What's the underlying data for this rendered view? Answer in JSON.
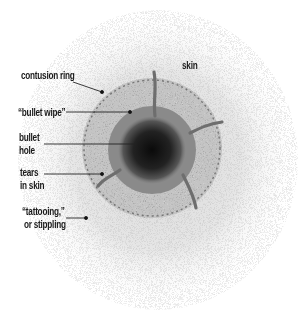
{
  "diagram": {
    "labels": [
      {
        "id": "skin",
        "text": "skin"
      },
      {
        "id": "contusion_ring",
        "text": "contusion ring"
      },
      {
        "id": "bullet_wipe",
        "text": "“bullet wipe”"
      },
      {
        "id": "bullet_hole_1",
        "text": "bullet"
      },
      {
        "id": "bullet_hole_2",
        "text": "hole"
      },
      {
        "id": "tears_1",
        "text": "tears"
      },
      {
        "id": "tears_2",
        "text": "in skin"
      },
      {
        "id": "tattooing_1",
        "text": "“tattooing,”"
      },
      {
        "id": "tattooing_2",
        "text": "or stippling"
      }
    ],
    "colors": {
      "background": "#ffffff",
      "skin_speckle": "#b8b8b8",
      "stipple_zone": "#9a9a9a",
      "wipe_ring": "#7a7a7a",
      "hole": "#111111",
      "leader_line": "#222222"
    }
  }
}
